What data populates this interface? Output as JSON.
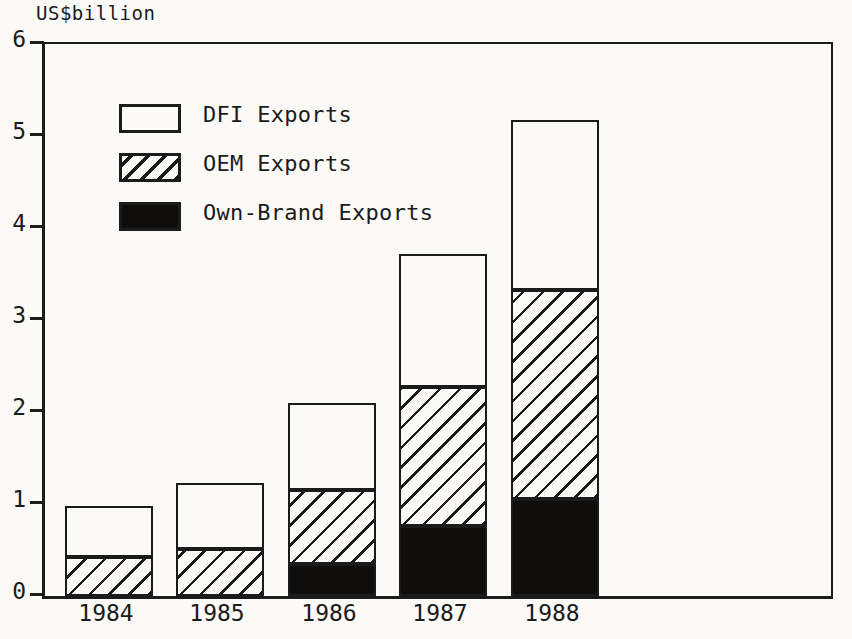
{
  "axis_unit_label": "US$billion",
  "legend": {
    "items": [
      {
        "label": "DFI Exports",
        "swatch": "empty-white-swatch"
      },
      {
        "label": "OEM Exports",
        "swatch": "diagonal-hatch-swatch"
      },
      {
        "label": "Own-Brand Exports",
        "swatch": "solid-black-swatch"
      }
    ]
  },
  "yaxis": {
    "ticks": [
      "0",
      "1",
      "2",
      "3",
      "4",
      "5",
      "6"
    ]
  },
  "xaxis": {
    "ticks": [
      "1984",
      "1985",
      "1986",
      "1987",
      "1988"
    ]
  },
  "chart_data": {
    "type": "bar",
    "subtype": "stacked",
    "title": "",
    "subtitle": "",
    "xlabel": "",
    "ylabel": "US$billion",
    "ylim": [
      0,
      6
    ],
    "ytick_values": [
      0,
      1,
      2,
      3,
      4,
      5,
      6
    ],
    "grid": false,
    "legend_position": "top-left-inside",
    "categories": [
      "1984",
      "1985",
      "1986",
      "1987",
      "1988"
    ],
    "series": [
      {
        "name": "Own-Brand Exports",
        "values": [
          0.0,
          0.0,
          0.35,
          0.76,
          1.05
        ],
        "fill": "solid-black"
      },
      {
        "name": "OEM Exports",
        "values": [
          0.42,
          0.51,
          0.8,
          1.51,
          2.28
        ],
        "fill": "diagonal-hatch"
      },
      {
        "name": "DFI Exports",
        "values": [
          0.56,
          0.72,
          0.95,
          1.45,
          1.84
        ],
        "fill": "empty-white"
      }
    ],
    "cumulative_tops": {
      "Own-Brand Exports": [
        0.0,
        0.0,
        0.35,
        0.76,
        1.05
      ],
      "OEM Exports": [
        0.42,
        0.51,
        1.15,
        2.27,
        3.33
      ],
      "DFI Exports": [
        0.98,
        1.23,
        2.1,
        3.72,
        5.17
      ]
    },
    "totals": [
      0.98,
      1.23,
      2.1,
      3.72,
      5.17
    ]
  },
  "geometry": {
    "plot_left_px": 42,
    "plot_top_px": 42,
    "plot_width_px": 786,
    "plot_height_px": 552,
    "px_per_unit": 92,
    "bar_width_px": 88,
    "bar_lefts_px": [
      62,
      173,
      285,
      396,
      508
    ]
  },
  "colors": {
    "ink": "#1b1b1b",
    "paper": "#fbfaf6",
    "solid_fill": "#100e0c"
  }
}
